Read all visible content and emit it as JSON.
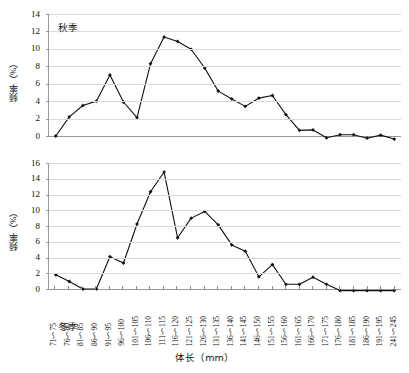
{
  "chart_data": [
    {
      "type": "line",
      "title": "秋季",
      "xlabel": "体长（mm）",
      "ylabel": "频率（%）",
      "ylim": [
        0,
        14
      ],
      "ytick_step": 2,
      "yticks": [
        "0",
        "2",
        "4",
        "6",
        "8",
        "10",
        "12",
        "14"
      ],
      "grid": true,
      "legend": "none",
      "categories": [
        "71～75",
        "76～80",
        "81～85",
        "86～90",
        "91～95",
        "96～100",
        "101～105",
        "106～110",
        "111～115",
        "116～120",
        "121～125",
        "126～130",
        "131～135",
        "136～140",
        "141～145",
        "146～150",
        "151～155",
        "156～160",
        "161～165",
        "166～170",
        "171～175",
        "176～180",
        "181～185",
        "186～190",
        "191～195",
        "241～245"
      ],
      "values": [
        0.0,
        2.2,
        3.5,
        4.0,
        7.0,
        3.9,
        2.1,
        8.3,
        11.35,
        10.85,
        9.95,
        7.8,
        5.15,
        4.25,
        3.4,
        4.35,
        4.65,
        2.45,
        0.65,
        0.7,
        -0.2,
        0.15,
        0.15,
        -0.25,
        0.1,
        -0.35
      ]
    },
    {
      "type": "line",
      "title": "冬季",
      "xlabel": "体长（mm）",
      "ylabel": "频率（%）",
      "ylim": [
        0,
        16
      ],
      "ytick_step": 2,
      "yticks": [
        "0",
        "2",
        "4",
        "6",
        "8",
        "10",
        "12",
        "14",
        "16"
      ],
      "grid": true,
      "legend": "none",
      "categories": [
        "71～75",
        "76～80",
        "81～85",
        "86～90",
        "91～95",
        "96～100",
        "101～105",
        "106～110",
        "111～115",
        "116～120",
        "121～125",
        "126～130",
        "131～135",
        "136～140",
        "141～145",
        "146～150",
        "151～155",
        "156～160",
        "161～165",
        "166～170",
        "171～175",
        "176～180",
        "181～185",
        "186～190",
        "191～195",
        "241～245"
      ],
      "values": [
        1.8,
        0.95,
        0.0,
        0.0,
        4.1,
        3.3,
        8.25,
        12.35,
        14.85,
        6.5,
        9.0,
        9.85,
        8.15,
        5.6,
        4.8,
        1.55,
        3.1,
        0.6,
        0.6,
        1.5,
        0.6,
        -0.2,
        -0.2,
        -0.2,
        -0.2,
        -0.2
      ]
    }
  ],
  "axis": {
    "x_title": "体长（mm）",
    "y_title": "频率（%）",
    "x_tick_labels": [
      "71～75",
      "76～80",
      "81～85",
      "86～90",
      "91～95",
      "96～100",
      "101～105",
      "106～110",
      "111～115",
      "116～120",
      "121～125",
      "126～130",
      "131～135",
      "136～140",
      "141～145",
      "146～150",
      "151～155",
      "156～160",
      "161～165",
      "166～170",
      "171～175",
      "176～180",
      "181～185",
      "186～190",
      "191～195",
      "241～245"
    ]
  },
  "style": {
    "line_color": "#111111",
    "marker_color": "#111111",
    "grid_color": "#d9d9d9",
    "axis_color": "#9a9a9a",
    "background": "#ffffff"
  }
}
